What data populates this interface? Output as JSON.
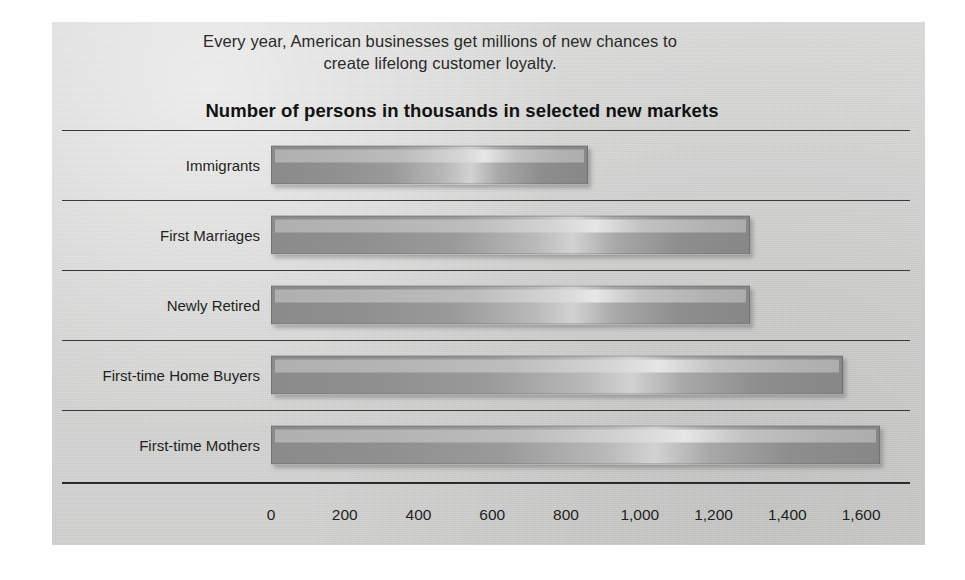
{
  "panel": {
    "background_color": "#d5d6d4"
  },
  "header": {
    "subtitle_line1": "Every year, American businesses get millions of new chances to",
    "subtitle_line2": "create lifelong customer loyalty."
  },
  "chart_data": {
    "type": "bar",
    "orientation": "horizontal",
    "title": "Number of persons in thousands in selected new markets",
    "xlabel": "",
    "ylabel": "",
    "xlim": [
      0,
      1700
    ],
    "grid": false,
    "legend": false,
    "categories": [
      "Immigrants",
      "First Marriages",
      "Newly Retired",
      "First-time Home Buyers",
      "First-time Mothers"
    ],
    "values": [
      860,
      1300,
      1300,
      1550,
      1650
    ],
    "units": "thousands of persons",
    "xticks": [
      0,
      200,
      400,
      600,
      800,
      1000,
      1200,
      1400,
      1600
    ],
    "xtick_labels": [
      "0",
      "200",
      "400",
      "600",
      "800",
      "1,000",
      "1,200",
      "1,400",
      "1,600"
    ],
    "bar_fill_color": "#9a9a9a",
    "bar_highlight_color": "#d6d6d6",
    "rule_color": "#3b3b3b"
  }
}
